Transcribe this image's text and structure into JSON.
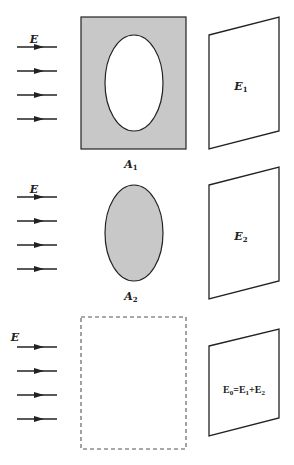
{
  "colors": {
    "stroke": "#222222",
    "fill_gray": "#c8c8c8",
    "dashed": "#555555",
    "background": "#ffffff"
  },
  "panels": [
    {
      "id": "panel-1",
      "field_label": "E",
      "aperture_label": "A",
      "aperture_sub": "1",
      "screen_label": "E",
      "screen_sub": "1",
      "description": "Opaque plate with elliptical hole"
    },
    {
      "id": "panel-2",
      "field_label": "E",
      "aperture_label": "A",
      "aperture_sub": "2",
      "screen_label": "E",
      "screen_sub": "2",
      "description": "Complementary opaque elliptical disk"
    },
    {
      "id": "panel-3",
      "field_label": "E",
      "screen_equation": {
        "lhs": "E",
        "lhs_sub": "0",
        "eq": "=",
        "t1": "E",
        "t1_sub": "1",
        "plus": "+",
        "t2": "E",
        "t2_sub": "2"
      },
      "description": "No obstacle (dashed outline)"
    }
  ]
}
